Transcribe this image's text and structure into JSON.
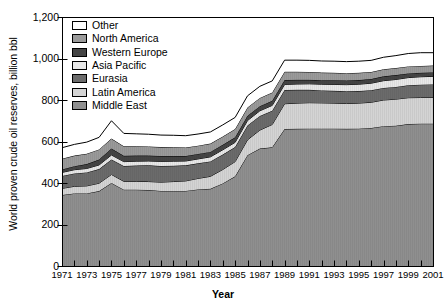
{
  "chart_data": {
    "type": "area",
    "stacked": true,
    "title": "",
    "xlabel": "Year",
    "ylabel": "World proven crude oil reserves, billion bbl",
    "xlim": [
      1971,
      2001
    ],
    "ylim": [
      0,
      1200
    ],
    "yticks": [
      0,
      200,
      400,
      600,
      800,
      1000,
      1200
    ],
    "ytick_labels": [
      "0",
      "200",
      "400",
      "600",
      "800",
      "1,000",
      "1,200"
    ],
    "x": [
      1971,
      1972,
      1973,
      1974,
      1975,
      1976,
      1977,
      1978,
      1979,
      1980,
      1981,
      1982,
      1983,
      1984,
      1985,
      1986,
      1987,
      1988,
      1989,
      1990,
      1991,
      1992,
      1993,
      1994,
      1995,
      1996,
      1997,
      1998,
      1999,
      2000,
      2001
    ],
    "xtick_labels": [
      "1971",
      "1973",
      "1975",
      "1977",
      "1979",
      "1981",
      "1983",
      "1985",
      "1987",
      "1989",
      "1991",
      "1993",
      "1995",
      "1997",
      "1999",
      "2001"
    ],
    "xtick_values": [
      1971,
      1973,
      1975,
      1977,
      1979,
      1981,
      1983,
      1985,
      1987,
      1989,
      1991,
      1993,
      1995,
      1997,
      1999,
      2001
    ],
    "minor_xticks_every": 1,
    "grid": false,
    "legend_position": "upper-left-inside",
    "stack_order_bottom_to_top": [
      "Middle East",
      "Latin America",
      "Eurasia",
      "Asia Pacific",
      "Western Europe",
      "North America",
      "Other"
    ],
    "series": [
      {
        "name": "Middle East",
        "color": "#8f8f8f",
        "values": [
          342,
          350,
          350,
          361,
          400,
          368,
          368,
          366,
          362,
          362,
          362,
          369,
          372,
          398,
          432,
          534,
          566,
          572,
          660,
          661,
          662,
          662,
          662,
          661,
          662,
          665,
          674,
          676,
          684,
          686,
          686
        ]
      },
      {
        "name": "Latin America",
        "color": "#d4d4d4",
        "values": [
          32,
          34,
          36,
          38,
          41,
          40,
          40,
          41,
          42,
          45,
          48,
          53,
          60,
          67,
          71,
          74,
          89,
          110,
          122,
          124,
          125,
          124,
          123,
          122,
          123,
          124,
          126,
          128,
          127,
          126,
          126
        ]
      },
      {
        "name": "Eurasia",
        "color": "#6b6b6b",
        "values": [
          60,
          62,
          65,
          68,
          72,
          74,
          76,
          78,
          78,
          76,
          75,
          73,
          72,
          72,
          70,
          69,
          68,
          66,
          66,
          64,
          62,
          60,
          59,
          59,
          58,
          58,
          58,
          59,
          60,
          62,
          63
        ]
      },
      {
        "name": "Asia Pacific",
        "color": "#e8e8e8",
        "values": [
          17,
          18,
          19,
          20,
          22,
          21,
          21,
          21,
          22,
          22,
          21,
          21,
          22,
          23,
          23,
          24,
          25,
          26,
          27,
          28,
          29,
          30,
          31,
          32,
          33,
          34,
          35,
          36,
          37,
          38,
          39
        ]
      },
      {
        "name": "Western Europe",
        "color": "#444444",
        "values": [
          14,
          17,
          21,
          26,
          31,
          28,
          27,
          26,
          26,
          25,
          24,
          24,
          24,
          24,
          24,
          23,
          22,
          22,
          21,
          20,
          19,
          19,
          20,
          20,
          20,
          20,
          21,
          21,
          20,
          19,
          19
        ]
      },
      {
        "name": "North America",
        "color": "#9a9a9a",
        "values": [
          52,
          51,
          50,
          49,
          48,
          46,
          45,
          44,
          43,
          42,
          41,
          40,
          40,
          40,
          40,
          40,
          40,
          40,
          40,
          39,
          38,
          37,
          36,
          35,
          35,
          34,
          34,
          34,
          34,
          33,
          33
        ]
      },
      {
        "name": "Other",
        "color": "#ffffff",
        "values": [
          53,
          54,
          56,
          58,
          86,
          62,
          60,
          59,
          58,
          58,
          57,
          56,
          56,
          56,
          56,
          56,
          56,
          56,
          56,
          56,
          56,
          56,
          56,
          56,
          56,
          56,
          58,
          60,
          62,
          64,
          62
        ]
      }
    ],
    "totals": [
      570,
      586,
      597,
      620,
      700,
      639,
      637,
      635,
      631,
      630,
      628,
      636,
      646,
      680,
      716,
      820,
      866,
      892,
      992,
      992,
      991,
      988,
      987,
      985,
      987,
      991,
      1006,
      1014,
      1024,
      1028,
      1028
    ]
  },
  "legend": {
    "items": [
      {
        "label": "Other",
        "color": "#ffffff"
      },
      {
        "label": "North America",
        "color": "#9a9a9a"
      },
      {
        "label": "Western Europe",
        "color": "#444444"
      },
      {
        "label": "Asia Pacific",
        "color": "#e8e8e8"
      },
      {
        "label": "Eurasia",
        "color": "#6b6b6b"
      },
      {
        "label": "Latin America",
        "color": "#d4d4d4"
      },
      {
        "label": "Middle East",
        "color": "#8f8f8f"
      }
    ]
  },
  "axes": {
    "y_title": "World proven crude oil reserves, billion bbl",
    "x_title": "Year"
  },
  "style": {
    "frame_color": "#000000",
    "background": "#ffffff",
    "line_color": "#000000"
  }
}
